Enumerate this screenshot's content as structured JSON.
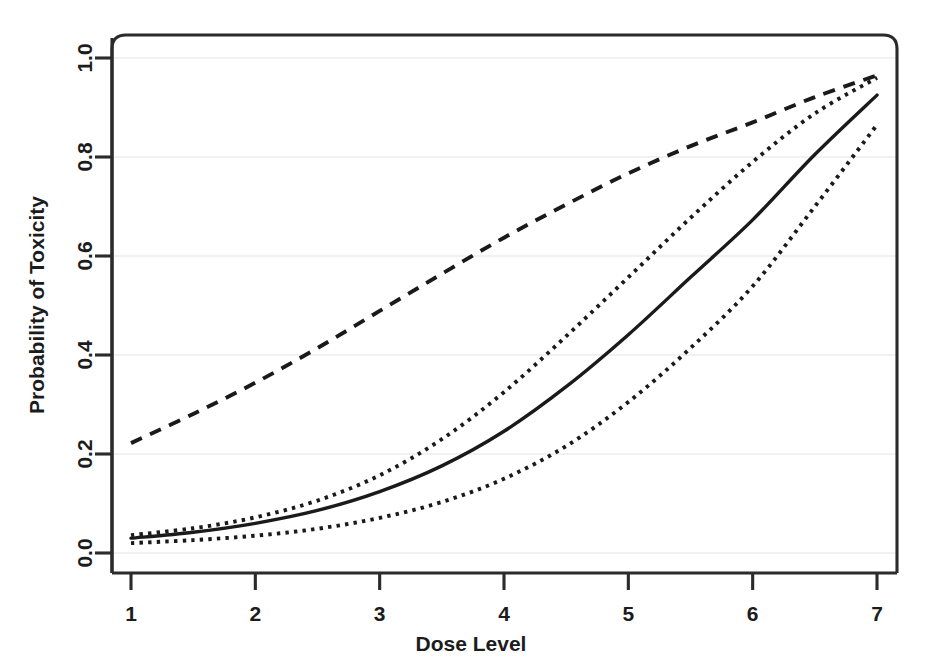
{
  "chart_data": {
    "type": "line",
    "title": "",
    "xlabel": "Dose Level",
    "ylabel": "Probability of Toxicity",
    "xlim": [
      1,
      7
    ],
    "ylim": [
      0.0,
      1.0
    ],
    "xticks": [
      1,
      2,
      3,
      4,
      5,
      6,
      7
    ],
    "xticklabels": [
      "1",
      "2",
      "3",
      "4",
      "5",
      "6",
      "7"
    ],
    "yticks": [
      0.0,
      0.2,
      0.4,
      0.6,
      0.8,
      1.0
    ],
    "yticklabels": [
      "0.0",
      "0.2",
      "0.4",
      "0.6",
      "0.8",
      "1.0"
    ],
    "grid": true,
    "grid_color": "#ececec",
    "legend": "none",
    "line_color": "#1a1a1a",
    "background": "#ffffff",
    "x": [
      1,
      1.5,
      2,
      2.5,
      3,
      3.5,
      4,
      4.5,
      5,
      5.5,
      6,
      6.5,
      7
    ],
    "series": [
      {
        "name": "Prior / skeleton curve",
        "style": "dashed",
        "values": [
          0.222,
          0.281,
          0.344,
          0.414,
          0.489,
          0.564,
          0.637,
          0.704,
          0.767,
          0.822,
          0.87,
          0.921,
          0.965
        ]
      },
      {
        "name": "Upper confidence bound",
        "style": "dotted",
        "values": [
          0.036,
          0.05,
          0.072,
          0.106,
          0.157,
          0.23,
          0.325,
          0.438,
          0.557,
          0.677,
          0.79,
          0.888,
          0.96
        ]
      },
      {
        "name": "Posterior mean toxicity",
        "style": "solid",
        "values": [
          0.03,
          0.042,
          0.06,
          0.086,
          0.124,
          0.176,
          0.246,
          0.336,
          0.441,
          0.557,
          0.673,
          0.805,
          0.925
        ]
      },
      {
        "name": "Lower confidence bound",
        "style": "dotted",
        "values": [
          0.02,
          0.026,
          0.035,
          0.049,
          0.071,
          0.103,
          0.15,
          0.216,
          0.305,
          0.414,
          0.539,
          0.7,
          0.865
        ]
      }
    ]
  },
  "axes": {
    "x_title": "Dose Level",
    "y_title": "Probability of Toxicity"
  },
  "geometry": {
    "plot_left": 112,
    "plot_right": 897,
    "plot_top": 35,
    "plot_bottom": 573,
    "x_origin_px": 131,
    "x_end_px": 877,
    "y_zero_px": 553,
    "y_one_px": 58,
    "corner_radius": 14
  }
}
